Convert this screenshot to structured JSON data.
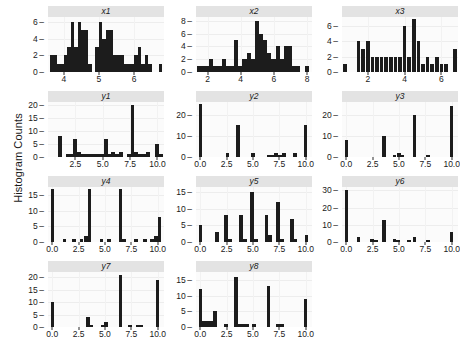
{
  "figure": {
    "ylabel": "Histogram Counts",
    "bar_color": "#1c1c1c",
    "strip_color": "#e3e3e3",
    "panel_color": "#fbfbfb",
    "grid_color": "#ededed"
  },
  "chart_data": {
    "type": "bar",
    "title": "",
    "xlabel": "",
    "ylabel": "Histogram Counts",
    "grid": true,
    "legend": "none",
    "layout": {
      "rows": 4,
      "cols": 3,
      "order": [
        "x1",
        "x2",
        "x3",
        "y1",
        "y2",
        "y3",
        "y4",
        "y5",
        "y6",
        "y7",
        "y8"
      ]
    },
    "panels": [
      {
        "name": "x1",
        "row": 0,
        "col": 0,
        "xlim": [
          3.55,
          6.85
        ],
        "ylim": [
          0,
          6.6
        ],
        "xticks": [
          4,
          5,
          6
        ],
        "xticklabels": [
          "4",
          "5",
          "6"
        ],
        "yticks": [
          0,
          2,
          4,
          6
        ],
        "yticklabels": [
          "0",
          "2",
          "4",
          "6"
        ],
        "bin_width": 0.1,
        "bin_starts": [
          3.6,
          3.7,
          3.8,
          3.9,
          4.0,
          4.1,
          4.2,
          4.3,
          4.4,
          4.5,
          4.6,
          4.7,
          4.8,
          4.9,
          5.0,
          5.1,
          5.2,
          5.3,
          5.4,
          5.5,
          5.6,
          5.7,
          5.8,
          5.9,
          6.0,
          6.1,
          6.2,
          6.3,
          6.4,
          6.5,
          6.6,
          6.7
        ],
        "values": [
          2,
          2,
          1,
          1,
          2,
          3,
          6,
          3,
          6,
          5,
          5,
          1,
          0,
          3,
          6,
          4,
          5,
          5,
          2,
          2,
          2,
          1,
          1,
          1,
          2,
          3,
          1,
          2,
          1,
          0,
          0,
          1
        ]
      },
      {
        "name": "x2",
        "row": 0,
        "col": 1,
        "xlim": [
          1.3,
          8.3
        ],
        "ylim": [
          0,
          8.6
        ],
        "xticks": [
          2,
          4,
          6,
          8
        ],
        "xticklabels": [
          "2",
          "4",
          "6",
          "8"
        ],
        "yticks": [
          0,
          2,
          4,
          6,
          8
        ],
        "yticklabels": [
          "0",
          "2",
          "4",
          "6",
          "8"
        ],
        "bin_width": 0.25,
        "bin_starts": [
          1.35,
          1.6,
          1.85,
          2.1,
          2.35,
          2.6,
          2.85,
          3.1,
          3.35,
          3.6,
          3.85,
          4.1,
          4.35,
          4.6,
          4.85,
          5.1,
          5.35,
          5.6,
          5.85,
          6.1,
          6.35,
          6.6,
          6.85,
          7.1,
          7.35,
          7.6,
          7.85
        ],
        "values": [
          1,
          1,
          1,
          2,
          1,
          1,
          2,
          1,
          1,
          5,
          1,
          2,
          3,
          2,
          8,
          6,
          5,
          3,
          2,
          4,
          2,
          4,
          4,
          1,
          1,
          0,
          1
        ]
      },
      {
        "name": "x3",
        "row": 0,
        "col": 2,
        "xlim": [
          0.6,
          6.9
        ],
        "ylim": [
          0,
          7.2
        ],
        "xticks": [
          2,
          4,
          6
        ],
        "xticklabels": [
          "2",
          "4",
          "6"
        ],
        "yticks": [
          0,
          2,
          4,
          6
        ],
        "yticklabels": [
          "0",
          "2",
          "4",
          "6"
        ],
        "bin_width": 0.2,
        "bin_starts": [
          0.65,
          0.9,
          1.15,
          1.4,
          1.65,
          1.9,
          2.15,
          2.4,
          2.65,
          2.9,
          3.15,
          3.4,
          3.65,
          3.9,
          4.15,
          4.4,
          4.65,
          4.9,
          5.15,
          5.4,
          5.65,
          5.9,
          6.15,
          6.4,
          6.65
        ],
        "values": [
          1,
          0,
          0,
          4,
          3,
          4,
          2,
          2,
          2,
          2,
          2,
          2,
          2,
          6,
          2,
          7,
          4,
          1,
          2,
          1,
          2,
          1,
          1,
          0,
          3
        ]
      },
      {
        "name": "y1",
        "row": 1,
        "col": 0,
        "xlim": [
          0.0,
          10.6
        ],
        "ylim": [
          0,
          21
        ],
        "xticks": [
          2.5,
          5.0,
          7.5,
          10.0
        ],
        "xticklabels": [
          "2.5",
          "5.0",
          "7.5",
          "10.0"
        ],
        "yticks": [
          0,
          5,
          10,
          15,
          20
        ],
        "yticklabels": [
          "0",
          "5",
          "10",
          "15",
          "20"
        ],
        "bin_width": 0.35,
        "bin_starts": [
          0.9,
          1.6,
          1.95,
          2.3,
          2.65,
          3.0,
          3.35,
          3.7,
          4.05,
          4.4,
          4.75,
          5.1,
          5.45,
          5.8,
          6.15,
          6.5,
          7.2,
          7.55,
          7.9,
          8.25,
          8.6,
          8.95,
          9.8,
          10.15
        ],
        "values": [
          8,
          1,
          1,
          7,
          2,
          1,
          1,
          1,
          1,
          1,
          1,
          7,
          1,
          2,
          1,
          2,
          1,
          20,
          2,
          1,
          1,
          2,
          5,
          1
        ]
      },
      {
        "name": "y2",
        "row": 1,
        "col": 1,
        "xlim": [
          -0.4,
          10.6
        ],
        "ylim": [
          0,
          26
        ],
        "xticks": [
          0.0,
          2.5,
          5.0,
          7.5,
          10.0
        ],
        "xticklabels": [
          "0.0",
          "2.5",
          "5.0",
          "7.5",
          "10.0"
        ],
        "yticks": [
          0,
          10,
          20
        ],
        "yticklabels": [
          "0",
          "10",
          "20"
        ],
        "bin_width": 0.35,
        "bin_starts": [
          -0.15,
          2.4,
          3.4,
          4.8,
          6.3,
          6.65,
          7.0,
          7.4,
          7.75,
          8.8,
          9.8
        ],
        "values": [
          25,
          2,
          15,
          2,
          1,
          1,
          2,
          1,
          2,
          2,
          15
        ]
      },
      {
        "name": "y3",
        "row": 1,
        "col": 2,
        "xlim": [
          -0.4,
          10.6
        ],
        "ylim": [
          0,
          26
        ],
        "xticks": [
          0.0,
          2.5,
          5.0,
          7.5,
          10.0
        ],
        "xticklabels": [
          "0.0",
          "2.5",
          "5.0",
          "7.5",
          "10.0"
        ],
        "yticks": [
          0,
          10,
          20
        ],
        "yticklabels": [
          "0",
          "10",
          "20"
        ],
        "bin_width": 0.35,
        "bin_starts": [
          -0.15,
          3.4,
          4.4,
          4.8,
          5.15,
          6.3,
          7.6,
          9.8
        ],
        "values": [
          8,
          10,
          1,
          2,
          1,
          20,
          1,
          24
        ]
      },
      {
        "name": "y4",
        "row": 2,
        "col": 0,
        "xlim": [
          -0.4,
          10.6
        ],
        "ylim": [
          0,
          17.5
        ],
        "xticks": [
          0.0,
          2.5,
          5.0,
          7.5,
          10.0
        ],
        "xticklabels": [
          "0.0",
          "2.5",
          "5.0",
          "7.5",
          "10.0"
        ],
        "yticks": [
          0,
          5,
          10,
          15
        ],
        "yticklabels": [
          "0",
          "5",
          "10",
          "15"
        ],
        "bin_width": 0.35,
        "bin_starts": [
          -0.15,
          1.0,
          1.9,
          2.6,
          3.0,
          3.35,
          4.5,
          5.2,
          6.3,
          6.65,
          7.8,
          8.6,
          9.3,
          9.65,
          10.0
        ],
        "values": [
          17,
          1,
          1,
          1,
          2,
          17,
          1,
          1,
          17,
          1,
          1,
          1,
          1,
          2,
          8
        ]
      },
      {
        "name": "y5",
        "row": 2,
        "col": 1,
        "xlim": [
          -0.4,
          10.6
        ],
        "ylim": [
          0,
          16.5
        ],
        "xticks": [
          0.0,
          2.5,
          5.0,
          7.5,
          10.0
        ],
        "xticklabels": [
          "0.0",
          "2.5",
          "5.0",
          "7.5",
          "10.0"
        ],
        "yticks": [
          0,
          5,
          10,
          15
        ],
        "yticklabels": [
          "0",
          "5",
          "10",
          "15"
        ],
        "bin_width": 0.35,
        "bin_starts": [
          -0.15,
          1.4,
          2.3,
          2.65,
          3.7,
          4.05,
          4.75,
          5.1,
          6.1,
          6.45,
          7.2,
          7.55,
          8.5,
          8.85,
          9.9
        ],
        "values": [
          5,
          3,
          8,
          1,
          8,
          1,
          15,
          1,
          8,
          2,
          12,
          1,
          7,
          1,
          2
        ]
      },
      {
        "name": "y6",
        "row": 2,
        "col": 2,
        "xlim": [
          -0.4,
          10.6
        ],
        "ylim": [
          0,
          32
        ],
        "xticks": [
          0.0,
          2.5,
          5.0,
          7.5,
          10.0
        ],
        "xticklabels": [
          "0.0",
          "2.5",
          "5.0",
          "7.5",
          "10.0"
        ],
        "yticks": [
          0,
          10,
          20,
          30
        ],
        "yticklabels": [
          "0",
          "10",
          "20",
          "30"
        ],
        "bin_width": 0.35,
        "bin_starts": [
          -0.15,
          1.0,
          2.3,
          2.65,
          3.4,
          4.4,
          4.75,
          5.8,
          6.3,
          7.6,
          9.8
        ],
        "values": [
          30,
          3,
          2,
          1,
          13,
          2,
          1,
          1,
          3,
          1,
          6
        ]
      },
      {
        "name": "y7",
        "row": 3,
        "col": 0,
        "xlim": [
          -0.4,
          10.6
        ],
        "ylim": [
          0,
          22
        ],
        "xticks": [
          0.0,
          2.5,
          5.0,
          7.5,
          10.0
        ],
        "xticklabels": [
          "0.0",
          "2.5",
          "5.0",
          "7.5",
          "10.0"
        ],
        "yticks": [
          0,
          5,
          10,
          15,
          20
        ],
        "yticklabels": [
          "0",
          "5",
          "10",
          "15",
          "20"
        ],
        "bin_width": 0.35,
        "bin_starts": [
          -0.15,
          3.2,
          3.55,
          4.6,
          4.95,
          6.3,
          7.2,
          7.9,
          8.25,
          9.8
        ],
        "values": [
          10,
          4,
          1,
          1,
          2,
          21,
          1,
          1,
          1,
          19
        ]
      },
      {
        "name": "y8",
        "row": 3,
        "col": 1,
        "xlim": [
          -0.4,
          10.6
        ],
        "ylim": [
          0,
          17.5
        ],
        "xticks": [
          0.0,
          2.5,
          5.0,
          7.5,
          10.0
        ],
        "xticklabels": [
          "0.0",
          "2.5",
          "5.0",
          "7.5",
          "10.0"
        ],
        "yticks": [
          0,
          5,
          10,
          15
        ],
        "yticklabels": [
          "0",
          "5",
          "10",
          "15"
        ],
        "bin_width": 0.35,
        "bin_starts": [
          -0.15,
          0.2,
          0.55,
          0.9,
          1.25,
          2.3,
          3.2,
          3.55,
          3.9,
          4.25,
          4.95,
          6.3,
          7.2,
          7.55,
          9.8
        ],
        "values": [
          12,
          2,
          2,
          2,
          5,
          1,
          16,
          1,
          1,
          1,
          1,
          13,
          1,
          1,
          9
        ]
      }
    ]
  }
}
